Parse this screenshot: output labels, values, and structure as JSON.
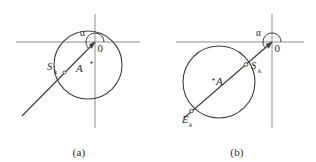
{
  "figure": {
    "kind": "geometry-diagram-pair",
    "background_color": "#ffffff",
    "stroke_color": "#3a3a3a",
    "axis_color": "#8d8d8d",
    "text_color": "#2b2b2b"
  },
  "panel_a": {
    "caption": "(a)",
    "origin_label": "0",
    "angle_label": "α",
    "center_label": "A",
    "start_point_label": "S",
    "start_point_sub": "k",
    "axes": {
      "horizontal_y": 42,
      "vertical_x": 95,
      "h_x1": 16,
      "h_x2": 140,
      "v_y1": 14,
      "v_y2": 128
    },
    "circle": {
      "cx": 88,
      "cy": 65,
      "r": 34
    },
    "ray": {
      "x1": 95,
      "y1": 42,
      "x2": 22,
      "y2": 116
    },
    "arc": {
      "cx": 95,
      "cy": 42,
      "r": 9
    },
    "center_dot": {
      "cx": 91,
      "cy": 63
    },
    "start_dot": {
      "cx": 64,
      "cy": 73
    }
  },
  "panel_b": {
    "caption": "(b)",
    "origin_label": "0",
    "angle_label": "α",
    "center_label": "A",
    "start_point_label": "S",
    "start_point_sub": "k",
    "end_point_label": "E",
    "end_point_sub": "k",
    "axes": {
      "horizontal_y": 42,
      "vertical_x": 114,
      "h_x1": 18,
      "h_x2": 146,
      "v_y1": 14,
      "v_y2": 128
    },
    "circle": {
      "cx": 61,
      "cy": 82,
      "r": 36
    },
    "ray": {
      "x1": 114,
      "y1": 42,
      "x2": 26,
      "y2": 118
    },
    "arc": {
      "cx": 114,
      "cy": 42,
      "r": 9
    },
    "center_dot": {
      "cx": 57,
      "cy": 80
    },
    "start_dot": {
      "cx": 87,
      "cy": 65
    },
    "end_dot": {
      "cx": 34,
      "cy": 110
    }
  }
}
